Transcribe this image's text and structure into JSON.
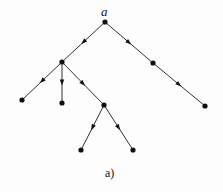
{
  "diagram": {
    "type": "directed-tree",
    "caption": "a)",
    "root_label": "a",
    "colors": {
      "edge": "#333333",
      "node": "#111111",
      "background": "#fdfdfd"
    },
    "nodes": [
      {
        "id": "a",
        "x": 105,
        "y": 22,
        "label": "a"
      },
      {
        "id": "b",
        "x": 62,
        "y": 62,
        "label": ""
      },
      {
        "id": "c",
        "x": 153,
        "y": 63,
        "label": ""
      },
      {
        "id": "d",
        "x": 22,
        "y": 100,
        "label": ""
      },
      {
        "id": "e",
        "x": 62,
        "y": 103,
        "label": ""
      },
      {
        "id": "f",
        "x": 104,
        "y": 105,
        "label": ""
      },
      {
        "id": "g",
        "x": 205,
        "y": 106,
        "label": ""
      },
      {
        "id": "h",
        "x": 81,
        "y": 150,
        "label": ""
      },
      {
        "id": "i",
        "x": 133,
        "y": 150,
        "label": ""
      }
    ],
    "edges": [
      {
        "from": "a",
        "to": "b"
      },
      {
        "from": "a",
        "to": "c"
      },
      {
        "from": "c",
        "to": "g"
      },
      {
        "from": "b",
        "to": "d"
      },
      {
        "from": "b",
        "to": "e"
      },
      {
        "from": "b",
        "to": "f"
      },
      {
        "from": "f",
        "to": "h"
      },
      {
        "from": "f",
        "to": "i"
      }
    ]
  }
}
